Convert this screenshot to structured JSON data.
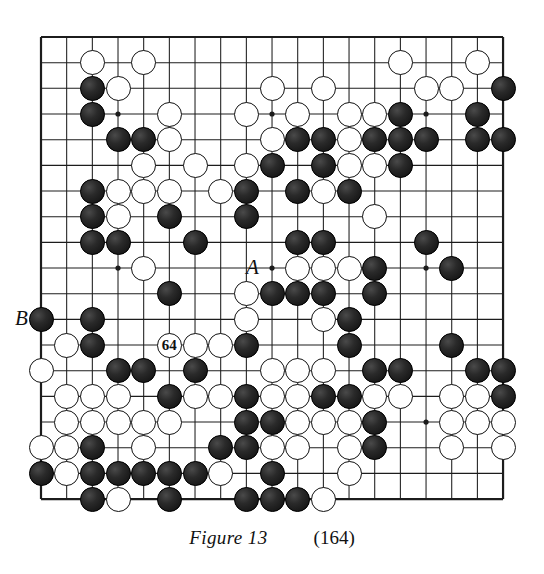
{
  "figure": {
    "caption_label": "Figure 13",
    "move_count": "(164)",
    "type": "go-board-diagram"
  },
  "board": {
    "size": 19,
    "left": 41,
    "top": 37,
    "spacing": 25.67,
    "line_color": "#1c1c1c",
    "border_color": "#111111",
    "black_color": "#1a1a1a",
    "white_color": "#ffffff",
    "stone_diameter": 25,
    "star_points": [
      [
        3,
        3
      ],
      [
        9,
        3
      ],
      [
        15,
        3
      ],
      [
        3,
        9
      ],
      [
        9,
        9
      ],
      [
        15,
        9
      ],
      [
        3,
        15
      ],
      [
        9,
        15
      ],
      [
        15,
        15
      ]
    ],
    "black_stones": [
      [
        2,
        2
      ],
      [
        2,
        3
      ],
      [
        3,
        4
      ],
      [
        4,
        4
      ],
      [
        14,
        3
      ],
      [
        17,
        3
      ],
      [
        18,
        4
      ],
      [
        14,
        4
      ],
      [
        15,
        4
      ],
      [
        17,
        4
      ],
      [
        18,
        2
      ],
      [
        9,
        5
      ],
      [
        11,
        5
      ],
      [
        14,
        5
      ],
      [
        10,
        4
      ],
      [
        11,
        4
      ],
      [
        13,
        4
      ],
      [
        14,
        4
      ],
      [
        15,
        4
      ],
      [
        2,
        6
      ],
      [
        8,
        6
      ],
      [
        10,
        6
      ],
      [
        12,
        6
      ],
      [
        2,
        7
      ],
      [
        5,
        7
      ],
      [
        8,
        7
      ],
      [
        2,
        8
      ],
      [
        3,
        8
      ],
      [
        6,
        8
      ],
      [
        10,
        8
      ],
      [
        11,
        8
      ],
      [
        15,
        8
      ],
      [
        13,
        9
      ],
      [
        16,
        9
      ],
      [
        5,
        10
      ],
      [
        9,
        10
      ],
      [
        10,
        10
      ],
      [
        11,
        10
      ],
      [
        13,
        10
      ],
      [
        0,
        11
      ],
      [
        2,
        11
      ],
      [
        12,
        11
      ],
      [
        2,
        12
      ],
      [
        8,
        12
      ],
      [
        12,
        12
      ],
      [
        16,
        12
      ],
      [
        3,
        13
      ],
      [
        4,
        13
      ],
      [
        6,
        13
      ],
      [
        13,
        13
      ],
      [
        14,
        13
      ],
      [
        17,
        13
      ],
      [
        18,
        13
      ],
      [
        5,
        14
      ],
      [
        8,
        14
      ],
      [
        11,
        14
      ],
      [
        12,
        14
      ],
      [
        18,
        14
      ],
      [
        8,
        15
      ],
      [
        9,
        15
      ],
      [
        13,
        15
      ],
      [
        2,
        16
      ],
      [
        7,
        16
      ],
      [
        8,
        16
      ],
      [
        13,
        16
      ],
      [
        0,
        17
      ],
      [
        2,
        17
      ],
      [
        3,
        17
      ],
      [
        4,
        17
      ],
      [
        5,
        17
      ],
      [
        6,
        17
      ],
      [
        9,
        17
      ],
      [
        2,
        18
      ],
      [
        5,
        18
      ],
      [
        8,
        18
      ],
      [
        9,
        18
      ],
      [
        10,
        18
      ]
    ],
    "white_stones": [
      [
        2,
        1
      ],
      [
        4,
        1
      ],
      [
        14,
        1
      ],
      [
        17,
        1
      ],
      [
        3,
        2
      ],
      [
        9,
        2
      ],
      [
        11,
        2
      ],
      [
        15,
        2
      ],
      [
        16,
        2
      ],
      [
        5,
        3
      ],
      [
        8,
        3
      ],
      [
        10,
        3
      ],
      [
        12,
        3
      ],
      [
        13,
        3
      ],
      [
        5,
        4
      ],
      [
        12,
        4
      ],
      [
        9,
        4
      ],
      [
        4,
        5
      ],
      [
        6,
        5
      ],
      [
        8,
        5
      ],
      [
        12,
        5
      ],
      [
        13,
        5
      ],
      [
        3,
        6
      ],
      [
        4,
        6
      ],
      [
        5,
        6
      ],
      [
        7,
        6
      ],
      [
        11,
        6
      ],
      [
        3,
        7
      ],
      [
        13,
        7
      ],
      [
        4,
        9
      ],
      [
        10,
        9
      ],
      [
        11,
        9
      ],
      [
        12,
        9
      ],
      [
        8,
        10
      ],
      [
        1,
        12
      ],
      [
        8,
        11
      ],
      [
        11,
        11
      ],
      [
        6,
        12
      ],
      [
        7,
        12
      ],
      [
        5,
        12
      ],
      [
        0,
        13
      ],
      [
        9,
        13
      ],
      [
        10,
        13
      ],
      [
        11,
        13
      ],
      [
        1,
        14
      ],
      [
        2,
        14
      ],
      [
        3,
        14
      ],
      [
        6,
        14
      ],
      [
        7,
        14
      ],
      [
        9,
        14
      ],
      [
        10,
        14
      ],
      [
        13,
        14
      ],
      [
        14,
        14
      ],
      [
        16,
        14
      ],
      [
        17,
        14
      ],
      [
        1,
        15
      ],
      [
        2,
        15
      ],
      [
        3,
        15
      ],
      [
        4,
        15
      ],
      [
        5,
        15
      ],
      [
        10,
        15
      ],
      [
        11,
        15
      ],
      [
        12,
        15
      ],
      [
        16,
        15
      ],
      [
        17,
        15
      ],
      [
        18,
        15
      ],
      [
        1,
        16
      ],
      [
        0,
        16
      ],
      [
        4,
        16
      ],
      [
        9,
        16
      ],
      [
        10,
        16
      ],
      [
        12,
        16
      ],
      [
        16,
        16
      ],
      [
        18,
        16
      ],
      [
        1,
        17
      ],
      [
        7,
        17
      ],
      [
        12,
        17
      ],
      [
        3,
        18
      ],
      [
        11,
        18
      ]
    ],
    "markers": [
      {
        "name": "move-64",
        "label": "64",
        "col": 5,
        "row": 12,
        "on": "white"
      }
    ],
    "edge_labels": [
      {
        "name": "point-a",
        "label": "A",
        "col": 9,
        "row": 9,
        "align": "left"
      },
      {
        "name": "point-b",
        "label": "B",
        "col": 0,
        "row": 11,
        "align": "left"
      }
    ]
  }
}
